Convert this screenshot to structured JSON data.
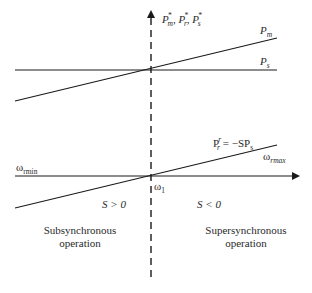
{
  "diagram": {
    "y_axis_label": {
      "P": "P",
      "m_sub": "m",
      "r_sub": "r",
      "s_sub": "s",
      "star": "*",
      "sep": ", "
    },
    "lines": {
      "Pm": {
        "label_P": "P",
        "label_sub": "m"
      },
      "Ps": {
        "label_P": "P",
        "label_sub": "s"
      },
      "Pr": {
        "label_P": "P",
        "label_sup": "r",
        "label_sub": "r",
        "equation_rest": " = −SP",
        "equation_sub": "s"
      }
    },
    "x_axis": {
      "w_min": {
        "symbol": "ω",
        "sub": "rmin"
      },
      "w_max": {
        "symbol": "ω",
        "sub": "rmax"
      },
      "w_1": {
        "symbol": "ω",
        "sub": "1"
      }
    },
    "regions": {
      "left_slip": "S > 0",
      "right_slip": "S < 0",
      "left_title_line1": "Subsynchronous",
      "left_title_line2": "operation",
      "right_title_line1": "Supersynchronous",
      "right_title_line2": "operation"
    },
    "colors": {
      "line": "#1a1a1a",
      "background": "#ffffff"
    }
  }
}
